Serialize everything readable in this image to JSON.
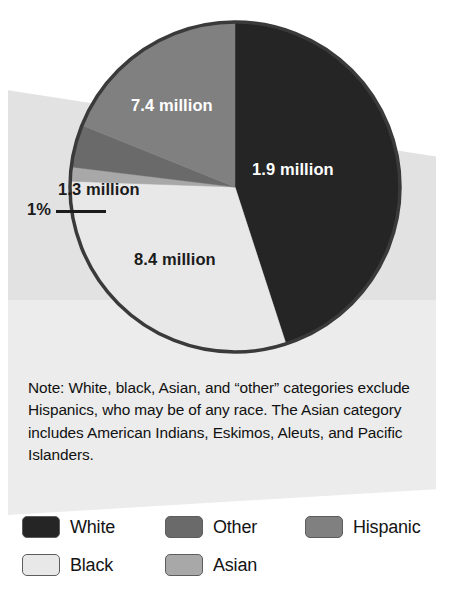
{
  "chart_data": {
    "type": "pie",
    "title": "",
    "subtitle": "",
    "xlabel": "",
    "ylabel": "",
    "unit": "millions of people",
    "legend_position": "bottom",
    "grid": false,
    "categories": [
      "White",
      "Hispanic",
      "Other",
      "Asian",
      "Black"
    ],
    "values": [
      1.9,
      7.4,
      1.3,
      0.24,
      8.4
    ],
    "value_labels": [
      "1.9 million",
      "7.4 million",
      "1.3 million",
      "1%",
      "8.4 million"
    ],
    "colors": [
      "#252525",
      "#808080",
      "#6a6a6a",
      "#a8a8a8",
      "#e8e8e8"
    ],
    "series": [
      {
        "name": "Population by race and ethnicity",
        "slices": [
          {
            "label": "White",
            "value": 1.9,
            "display": "1.9 million",
            "color": "#252525",
            "start_deg": 0,
            "end_deg": 162,
            "text_color": "#ffffff"
          },
          {
            "label": "Black",
            "value": 8.4,
            "display": "8.4 million",
            "color": "#e8e8e8",
            "start_deg": 162,
            "end_deg": 272,
            "text_color": "#1b1b1b"
          },
          {
            "label": "Asian",
            "value": 0.24,
            "display": "1%",
            "color": "#a8a8a8",
            "start_deg": 272,
            "end_deg": 277,
            "text_color": "#1b1b1b"
          },
          {
            "label": "Other",
            "value": 1.3,
            "display": "1.3 million",
            "color": "#6a6a6a",
            "start_deg": 277,
            "end_deg": 292,
            "text_color": "#1b1b1b"
          },
          {
            "label": "Hispanic",
            "value": 7.4,
            "display": "7.4 million",
            "color": "#808080",
            "start_deg": 292,
            "end_deg": 360,
            "text_color": "#ffffff"
          }
        ]
      }
    ],
    "annotations": [
      {
        "text": "1%",
        "points_to": "Asian",
        "kind": "leader-line"
      }
    ]
  },
  "labels": {
    "white": "1.9 million",
    "hispanic": "7.4 million",
    "other": "1.3 million",
    "asian_pct": "1%",
    "black": "8.4 million"
  },
  "note": {
    "text": "Note:  White, black, Asian, and “other” categories exclude Hispanics, who may be of any race. The Asian category includes American Indians, Eskimos, Aleuts, and Pacific Islanders."
  },
  "legend": {
    "items": [
      {
        "label": "White",
        "color": "#252525"
      },
      {
        "label": "Other",
        "color": "#6a6a6a"
      },
      {
        "label": "Hispanic",
        "color": "#808080"
      },
      {
        "label": "Black",
        "color": "#e8e8e8"
      },
      {
        "label": "Asian",
        "color": "#a8a8a8"
      }
    ]
  },
  "style": {
    "pie_outline": "#3a3a3a",
    "panel_color": "#e2e2e2",
    "page_background": "#ffffff"
  }
}
